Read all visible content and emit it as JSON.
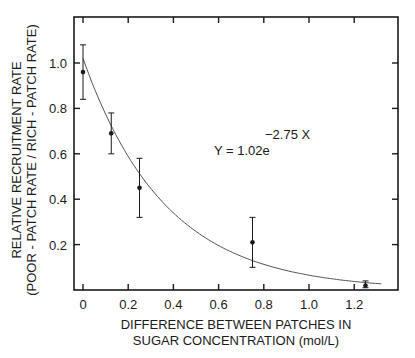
{
  "chart_data": {
    "type": "scatter",
    "title": "",
    "xlabel_lines": [
      "DIFFERENCE BETWEEN PATCHES IN",
      "SUGAR CONCENTRATION (mol/L)"
    ],
    "ylabel_lines": [
      "RELATIVE RECRUITMENT RATE",
      "(POOR - PATCH RATE / RICH - PATCH RATE)"
    ],
    "xlim": [
      -0.04,
      1.39
    ],
    "ylim": [
      0,
      1.2
    ],
    "x_ticks": [
      0,
      0.2,
      0.4,
      0.6,
      0.8,
      1.0,
      1.2
    ],
    "x_tick_labels": [
      "0",
      "0.2",
      "0.4",
      "0.6",
      "0.8",
      "1.0",
      "1.2"
    ],
    "y_ticks": [
      0.2,
      0.4,
      0.6,
      0.8,
      1.0
    ],
    "y_tick_labels": [
      "0.2",
      "0.4",
      "0.6",
      "0.8",
      "1.0"
    ],
    "grid": false,
    "legend": null,
    "series": [
      {
        "name": "observed",
        "type": "scatter",
        "x": [
          0,
          0.125,
          0.25,
          0.75,
          1.25
        ],
        "y": [
          0.96,
          0.69,
          0.45,
          0.21,
          0.02
        ],
        "error_low": [
          0.84,
          0.6,
          0.32,
          0.1,
          0.01
        ],
        "error_high": [
          1.08,
          0.78,
          0.58,
          0.32,
          0.04
        ]
      },
      {
        "name": "fit",
        "type": "line",
        "equation": "Y = 1.02e^(-2.75X)",
        "a": 1.02,
        "b": -2.75,
        "x_range": [
          0,
          1.32
        ]
      }
    ],
    "annotations": [
      {
        "text_base": "Y = 1.02e",
        "text_exponent": "−2.75 X",
        "x": 0.63,
        "y": 0.62
      }
    ]
  },
  "labels": {
    "equation_base": "Y = 1.02e",
    "equation_exponent": "−2.75 X",
    "xlabel_line1": "DIFFERENCE BETWEEN PATCHES IN",
    "xlabel_line2": "SUGAR CONCENTRATION (mol/L)",
    "ylabel_line1": "RELATIVE RECRUITMENT RATE",
    "ylabel_line2": "(POOR - PATCH RATE / RICH - PATCH RATE)"
  }
}
